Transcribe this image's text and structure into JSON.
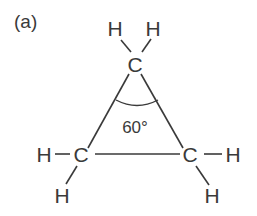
{
  "figure": {
    "panel_label": "(a)",
    "molecule": "cyclopropane",
    "angle_label": "60°"
  },
  "atoms": [
    {
      "id": "C1",
      "symbol": "C",
      "x": 135,
      "y": 71
    },
    {
      "id": "C2",
      "symbol": "C",
      "x": 81,
      "y": 162
    },
    {
      "id": "C3",
      "symbol": "C",
      "x": 190,
      "y": 162
    },
    {
      "id": "H1",
      "symbol": "H",
      "x": 115,
      "y": 36
    },
    {
      "id": "H2",
      "symbol": "H",
      "x": 152,
      "y": 36
    },
    {
      "id": "H3",
      "symbol": "H",
      "x": 41,
      "y": 162
    },
    {
      "id": "H4",
      "symbol": "H",
      "x": 61,
      "y": 203
    },
    {
      "id": "H5",
      "symbol": "H",
      "x": 233,
      "y": 162
    },
    {
      "id": "H6",
      "symbol": "H",
      "x": 212,
      "y": 203
    }
  ],
  "bonds": [
    {
      "from": "C1",
      "to": "C2"
    },
    {
      "from": "C1",
      "to": "C3"
    },
    {
      "from": "C2",
      "to": "C3"
    },
    {
      "from": "C1",
      "to": "H1"
    },
    {
      "from": "C1",
      "to": "H2"
    },
    {
      "from": "C2",
      "to": "H3"
    },
    {
      "from": "C2",
      "to": "H4"
    },
    {
      "from": "C3",
      "to": "H5"
    },
    {
      "from": "C3",
      "to": "H6"
    }
  ],
  "colors": {
    "ink": "#3a3a3a",
    "background": "#ffffff"
  }
}
